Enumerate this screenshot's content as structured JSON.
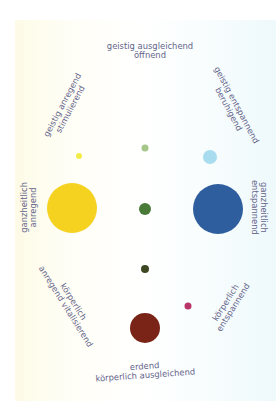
{
  "diagram": {
    "background": {
      "left_tint": "#fdfbe6",
      "right_tint": "#eef9fb",
      "center": "#ffffff"
    },
    "text_color": "#64648a",
    "labels": {
      "top": {
        "line1": "geistig ausgleichend",
        "line2": "öffnend"
      },
      "top_left": {
        "line1": "geistig anregend",
        "line2": "stimulierend"
      },
      "top_right": {
        "line1": "geistig entspannend",
        "line2": "beruhigend"
      },
      "left": {
        "line1": "ganzheitlich",
        "line2": "anregend"
      },
      "right": {
        "line1": "ganzheitlich",
        "line2": "entspannend"
      },
      "bottom_left": {
        "line1": "körperlich",
        "line2": "anregend vitalisierend"
      },
      "bottom_right": {
        "line1": "körperlich",
        "line2": "entspannend"
      },
      "bottom": {
        "line1": "erdend",
        "line2": "körperlich ausgleichend"
      }
    },
    "circles": [
      {
        "name": "yellow-large-circle",
        "cx": 72,
        "cy": 208,
        "r": 25,
        "color": "#f5d21f"
      },
      {
        "name": "blue-large-circle",
        "cx": 218,
        "cy": 209,
        "r": 25,
        "color": "#2e5e9e"
      },
      {
        "name": "yellow-small-circle",
        "cx": 79,
        "cy": 156,
        "r": 3,
        "color": "#f2ec46"
      },
      {
        "name": "light-green-small-circle",
        "cx": 145,
        "cy": 148,
        "r": 3.5,
        "color": "#a6c68a"
      },
      {
        "name": "light-blue-circle",
        "cx": 210,
        "cy": 157,
        "r": 7,
        "color": "#a8dcee"
      },
      {
        "name": "green-center-circle",
        "cx": 145,
        "cy": 209,
        "r": 6,
        "color": "#4a7a38"
      },
      {
        "name": "dark-olive-circle",
        "cx": 145,
        "cy": 269,
        "r": 4,
        "color": "#3d4722"
      },
      {
        "name": "maroon-circle",
        "cx": 145,
        "cy": 328,
        "r": 15,
        "color": "#7a2418"
      },
      {
        "name": "magenta-small-circle",
        "cx": 188,
        "cy": 306,
        "r": 3.5,
        "color": "#b8356a"
      }
    ]
  }
}
